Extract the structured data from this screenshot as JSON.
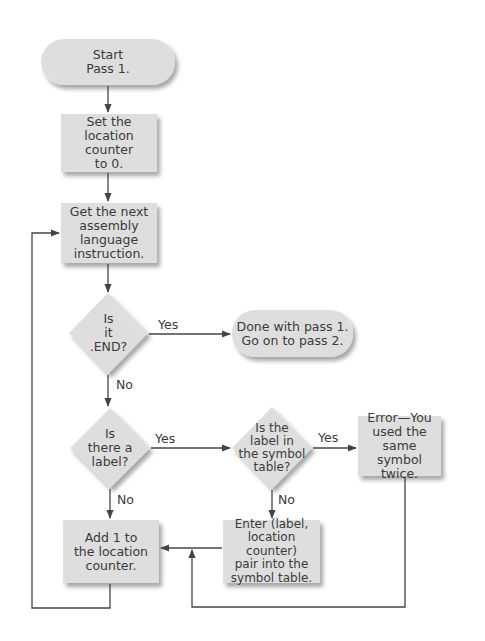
{
  "diagram": {
    "type": "flowchart",
    "colors": {
      "fill": "#dedede",
      "shadow": "#bdbdbd",
      "line": "#444444",
      "background": "#ffffff",
      "text": "#3a3a3a"
    },
    "nodes": {
      "start": {
        "shape": "terminal",
        "text": "Start\nPass 1."
      },
      "set_counter": {
        "shape": "process",
        "text": "Set the\nlocation counter\nto 0."
      },
      "get_next": {
        "shape": "process",
        "text": "Get the next\nassembly\nlanguage\ninstruction."
      },
      "is_end": {
        "shape": "decision",
        "text": "Is\nit\n.END?"
      },
      "done": {
        "shape": "terminal",
        "text": "Done with pass 1.\nGo on to pass 2."
      },
      "is_label": {
        "shape": "decision",
        "text": "Is\nthere a\nlabel?"
      },
      "in_table": {
        "shape": "decision",
        "text": "Is the\nlabel in\nthe symbol\ntable?"
      },
      "error": {
        "shape": "process",
        "text": "Error—You\nused the same\nsymbol twice."
      },
      "add_one": {
        "shape": "process",
        "text": "Add 1 to\nthe location\ncounter."
      },
      "enter_pair": {
        "shape": "process",
        "text": "Enter (label,\nlocation counter)\npair into the\nsymbol table."
      }
    },
    "edge_labels": {
      "is_end_yes": "Yes",
      "is_end_no": "No",
      "is_label_yes": "Yes",
      "is_label_no": "No",
      "in_table_yes": "Yes",
      "in_table_no": "No"
    },
    "edges": [
      {
        "from": "start",
        "to": "set_counter"
      },
      {
        "from": "set_counter",
        "to": "get_next"
      },
      {
        "from": "get_next",
        "to": "is_end"
      },
      {
        "from": "is_end",
        "to": "done",
        "label": "Yes"
      },
      {
        "from": "is_end",
        "to": "is_label",
        "label": "No"
      },
      {
        "from": "is_label",
        "to": "in_table",
        "label": "Yes"
      },
      {
        "from": "is_label",
        "to": "add_one",
        "label": "No"
      },
      {
        "from": "in_table",
        "to": "error",
        "label": "Yes"
      },
      {
        "from": "in_table",
        "to": "enter_pair",
        "label": "No"
      },
      {
        "from": "enter_pair",
        "to": "add_one"
      },
      {
        "from": "error",
        "to": "add_one"
      },
      {
        "from": "add_one",
        "to": "get_next"
      }
    ]
  }
}
